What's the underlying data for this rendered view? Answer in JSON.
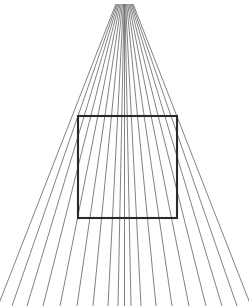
{
  "figure": {
    "canvas": {
      "width": 249,
      "height": 306,
      "background_color": "#ffffff"
    }
  },
  "chart_data": {
    "type": "line",
    "subtitle": "",
    "xlabel": "",
    "ylabel": "",
    "grid": false,
    "legend_position": "none",
    "xlim": [
      0,
      249
    ],
    "ylim": [
      0,
      306
    ],
    "annotations": [],
    "tick_labels": [],
    "series": [
      {
        "name": "radiating-lines",
        "kind": "fan",
        "color": "#6b6b6b",
        "stroke_width": 0.85,
        "count": 19,
        "vanishing_point": {
          "x": 124.5,
          "y": -18
        },
        "top_y": 4,
        "bottom_y": 306,
        "bottom_x_positions": [
          -2,
          12,
          27,
          43,
          60,
          77,
          93,
          108,
          118,
          124.5,
          131,
          141,
          156,
          172,
          189,
          206,
          222,
          237,
          251
        ]
      },
      {
        "name": "square-outline",
        "kind": "rect",
        "color": "#2a2a2a",
        "stroke_width": 2.1,
        "x": 78,
        "y": 116,
        "width": 99,
        "height": 102,
        "corners": [
          {
            "x": 78,
            "y": 116
          },
          {
            "x": 177,
            "y": 116
          },
          {
            "x": 177,
            "y": 218
          },
          {
            "x": 78,
            "y": 218
          }
        ]
      }
    ]
  }
}
